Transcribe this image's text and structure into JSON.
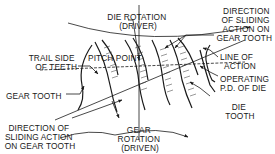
{
  "diagram": {
    "labels": {
      "die_rotation": [
        "DIE ROTATION",
        "(DRIVER)"
      ],
      "direction_sliding_top": [
        "DIRECTION",
        "OF SLIDING",
        "ACTION ON",
        "GEAR TOOTH"
      ],
      "trail_side": [
        "TRAIL SIDE",
        "OF TEETH"
      ],
      "pitch_point": "PITCH POINT",
      "line_of_action": [
        "LINE OF",
        "ACTION"
      ],
      "operating_pd": [
        "OPERATING",
        "P.D. OF DIE"
      ],
      "gear_tooth": "GEAR TOOTH",
      "die_tooth": [
        "DIE",
        "TOOTH"
      ],
      "direction_sliding_bottom": [
        "DIRECTION OF",
        "SLIDING ACTION",
        "ON GEAR TOOTH"
      ],
      "gear_rotation": [
        "GEAR",
        "ROTATION",
        "(DRIVEN)"
      ]
    }
  }
}
